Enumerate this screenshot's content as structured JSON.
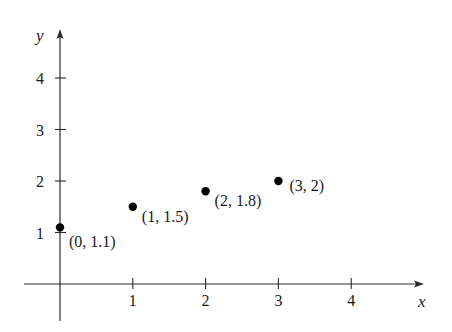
{
  "chart_data": {
    "type": "scatter",
    "title": "",
    "xlabel": "x",
    "ylabel": "y",
    "xlim": [
      -0.5,
      4.8
    ],
    "ylim": [
      -0.7,
      4.7
    ],
    "x_ticks": [
      1,
      2,
      3,
      4
    ],
    "y_ticks": [
      1,
      2,
      3,
      4
    ],
    "grid": false,
    "legend": null,
    "series": [
      {
        "name": "points",
        "points": [
          {
            "x": 0,
            "y": 1.1,
            "label": "(0, 1.1)"
          },
          {
            "x": 1,
            "y": 1.5,
            "label": "(1, 1.5)"
          },
          {
            "x": 2,
            "y": 1.8,
            "label": "(2, 1.8)"
          },
          {
            "x": 3,
            "y": 2,
            "label": "(3, 2)"
          }
        ]
      }
    ]
  },
  "colors": {
    "axis": "#2a2a2a",
    "point": "#000000",
    "text": "#1a1a1a"
  }
}
